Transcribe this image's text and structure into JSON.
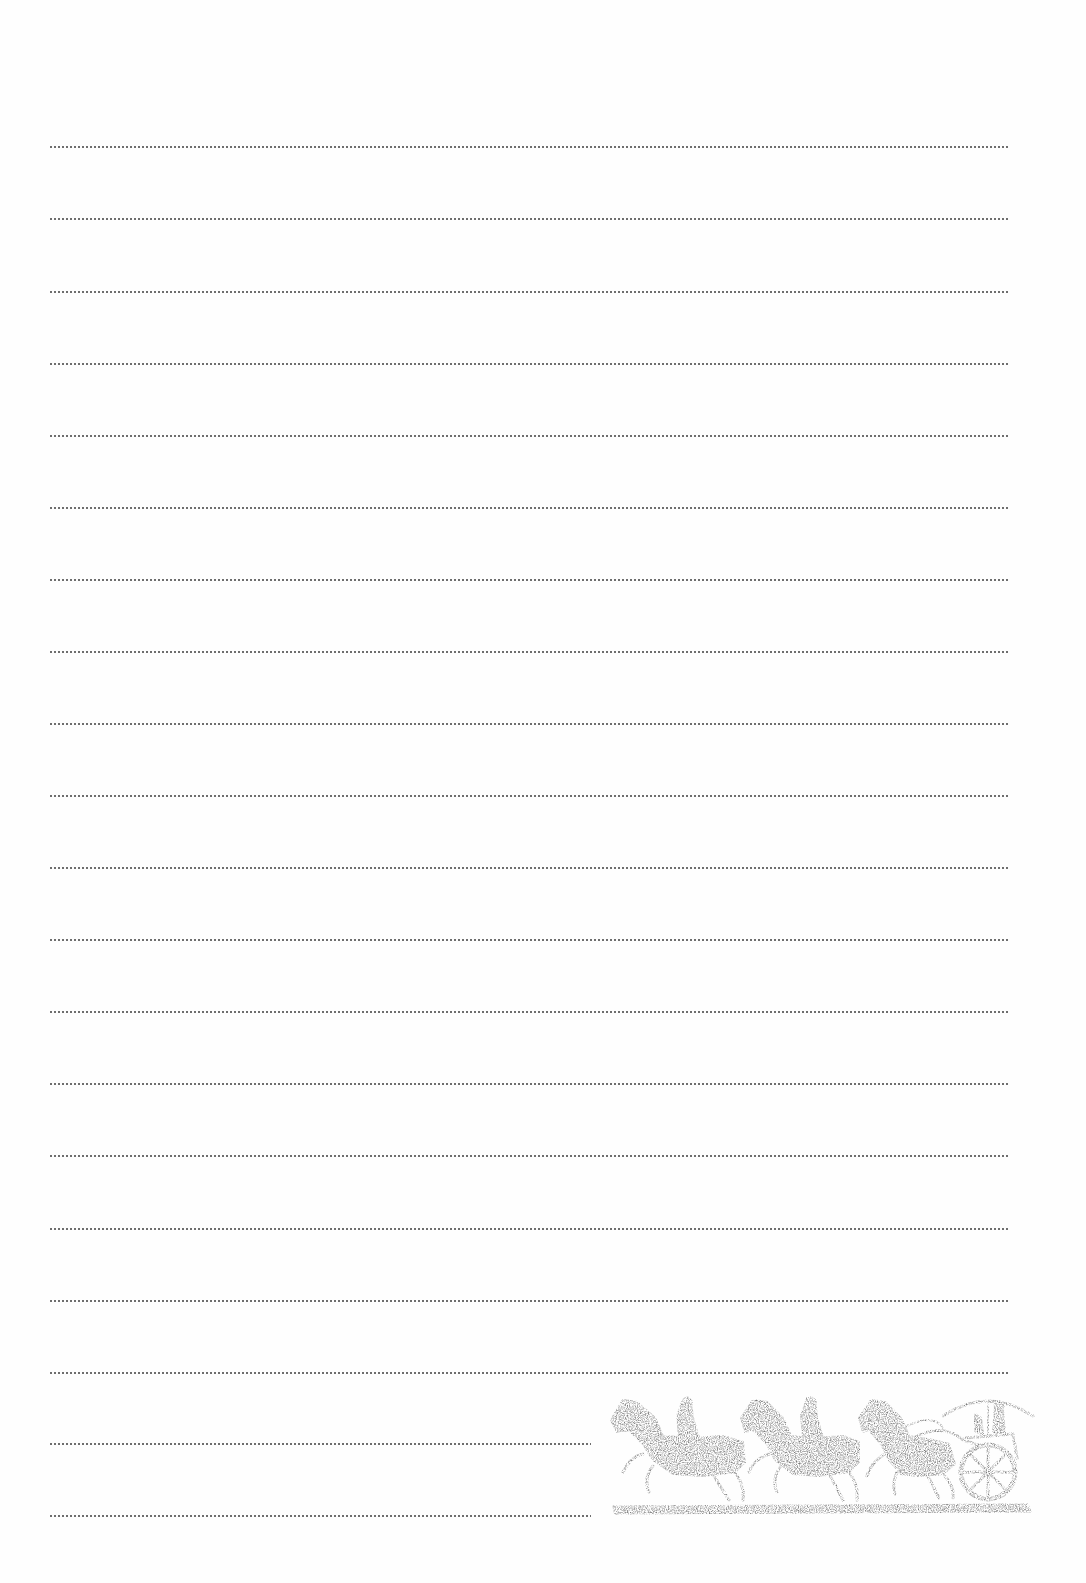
{
  "page": {
    "type": "lined-writing-paper",
    "background_color": "#fefefe",
    "rule_color": "#6e6e6e",
    "rule_style": "dotted",
    "rules": [
      {
        "y": 146,
        "length": "full"
      },
      {
        "y": 218,
        "length": "full"
      },
      {
        "y": 291,
        "length": "full"
      },
      {
        "y": 363,
        "length": "full"
      },
      {
        "y": 435,
        "length": "full"
      },
      {
        "y": 507,
        "length": "full"
      },
      {
        "y": 579,
        "length": "full"
      },
      {
        "y": 651,
        "length": "full"
      },
      {
        "y": 723,
        "length": "full"
      },
      {
        "y": 795,
        "length": "full"
      },
      {
        "y": 867,
        "length": "full"
      },
      {
        "y": 939,
        "length": "full"
      },
      {
        "y": 1011,
        "length": "full"
      },
      {
        "y": 1083,
        "length": "full"
      },
      {
        "y": 1155,
        "length": "full"
      },
      {
        "y": 1228,
        "length": "full"
      },
      {
        "y": 1300,
        "length": "full"
      },
      {
        "y": 1372,
        "length": "full"
      },
      {
        "y": 1443,
        "length": "short"
      },
      {
        "y": 1515,
        "length": "short"
      }
    ]
  },
  "illustration": {
    "subject": "stone-rubbing-horses-and-chariot",
    "ink_color": "#7a7a7a",
    "figures": [
      "horse-rider-1",
      "horse-rider-2",
      "horse-drawn-chariot"
    ]
  }
}
